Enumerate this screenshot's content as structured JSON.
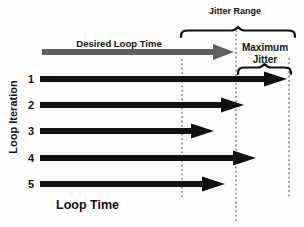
{
  "figure": {
    "description_labels": {
      "jitter_range": "Jitter Range",
      "desired_loop_time": "Desired Loop Time",
      "maximum_jitter_line1": "Maximum",
      "maximum_jitter_line2": "Jitter",
      "loop_iteration": "Loop Iteration",
      "loop_time": "Loop Time"
    }
  },
  "labels": {
    "jitter_range": "Jitter Range",
    "desired_loop_time": "Desired Loop Time",
    "maximum_jitter_line1": "Maximum",
    "maximum_jitter_line2": "Jitter",
    "loop_iteration": "Loop Iteration",
    "loop_time": "Loop Time"
  },
  "colors": {
    "arrow_black": "#111111",
    "arrow_gray": "#606060",
    "guide_dotted": "#8f8f8f",
    "background": "#fdfdfd",
    "text": "#111111"
  },
  "diagram": {
    "desired_arrow": {
      "start_x": 42,
      "tip_x": 234,
      "y": 52,
      "bar_width": 6,
      "head_len": 21,
      "head_half": 8
    },
    "arrow_style": {
      "start_x": 40,
      "bar_width": 6,
      "head_len": 23,
      "head_half": 7.5
    },
    "guides": [
      {
        "name": "jitter-range-left",
        "x": 182,
        "y1": 59,
        "y2": 197
      },
      {
        "name": "desired-loop-time",
        "x": 236,
        "y1": 30,
        "y2": 222
      },
      {
        "name": "maximum-jitter-right",
        "x": 289,
        "y1": 58,
        "y2": 197
      }
    ],
    "iterations": [
      {
        "label": "1",
        "y": 79,
        "tip_x": 287
      },
      {
        "label": "2",
        "y": 105,
        "tip_x": 244
      },
      {
        "label": "3",
        "y": 131,
        "tip_x": 214
      },
      {
        "label": "4",
        "y": 158,
        "tip_x": 256
      },
      {
        "label": "5",
        "y": 184,
        "tip_x": 225
      }
    ],
    "braces": [
      {
        "name": "jitter-range-brace",
        "x1": 181,
        "x2": 295,
        "y_top": 27
      },
      {
        "name": "maximum-jitter-brace",
        "x1": 238,
        "x2": 291,
        "y_top": 64
      }
    ]
  }
}
